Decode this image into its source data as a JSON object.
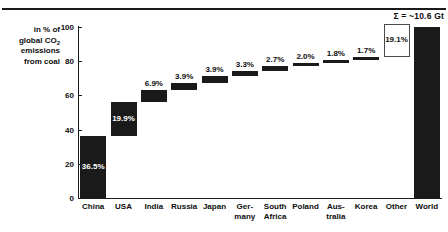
{
  "chart_data": {
    "type": "bar",
    "subtype": "waterfall",
    "title": "",
    "xlabel": "",
    "ylabel": "in % of global CO2 emissions from coal",
    "ylabel_lines": [
      "in % of",
      "global CO",
      "emissions",
      "from coal"
    ],
    "ylabel_subscript": "2",
    "ylim": [
      0,
      100
    ],
    "yticks": [
      0,
      20,
      40,
      60,
      80,
      100
    ],
    "ytick_labels": [
      "0",
      "20",
      "40",
      "60",
      "80",
      "100"
    ],
    "grid": false,
    "legend": false,
    "annotation": "Σ = ~10.6 Gt",
    "categories": [
      "China",
      "USA",
      "India",
      "Russia",
      "Japan",
      "Germany",
      "South Africa",
      "Poland",
      "Australia",
      "Korea",
      "Other",
      "World"
    ],
    "category_labels": [
      "China",
      "USA",
      "India",
      "Russia",
      "Japan",
      "Ger-\nmany",
      "South\nAfrica",
      "Poland",
      "Aus-\ntralia",
      "Korea",
      "Other",
      "World"
    ],
    "values": [
      36.5,
      19.9,
      6.9,
      3.9,
      3.9,
      3.3,
      2.7,
      2.0,
      1.8,
      1.7,
      19.1,
      100.0
    ],
    "value_labels": [
      "36.5%",
      "19.9%",
      "6.9%",
      "3.9%",
      "3.9%",
      "3.3%",
      "2.7%",
      "2.0%",
      "1.8%",
      "1.7%",
      "19.1%",
      ""
    ],
    "bar_bases": [
      0,
      36.5,
      56.4,
      63.3,
      67.2,
      71.1,
      74.4,
      77.1,
      79.1,
      80.9,
      82.6,
      0
    ],
    "bar_styles": [
      "filled",
      "filled",
      "filled",
      "filled",
      "filled",
      "filled",
      "filled",
      "filled",
      "filled",
      "filled",
      "hollow",
      "filled"
    ],
    "label_placement": [
      "inside",
      "inside",
      "above",
      "above",
      "above",
      "above",
      "above",
      "above",
      "above",
      "above",
      "inside",
      "none"
    ],
    "colors": {
      "bar_fill": "#1a1a1a",
      "bar_hollow_fill": "#ffffff",
      "bar_hollow_border": "#4a4a4a",
      "axis": "#1a1a1a",
      "text": "#0d0d0d",
      "inside_label_text": "#ffffff",
      "background": "#ffffff"
    }
  }
}
